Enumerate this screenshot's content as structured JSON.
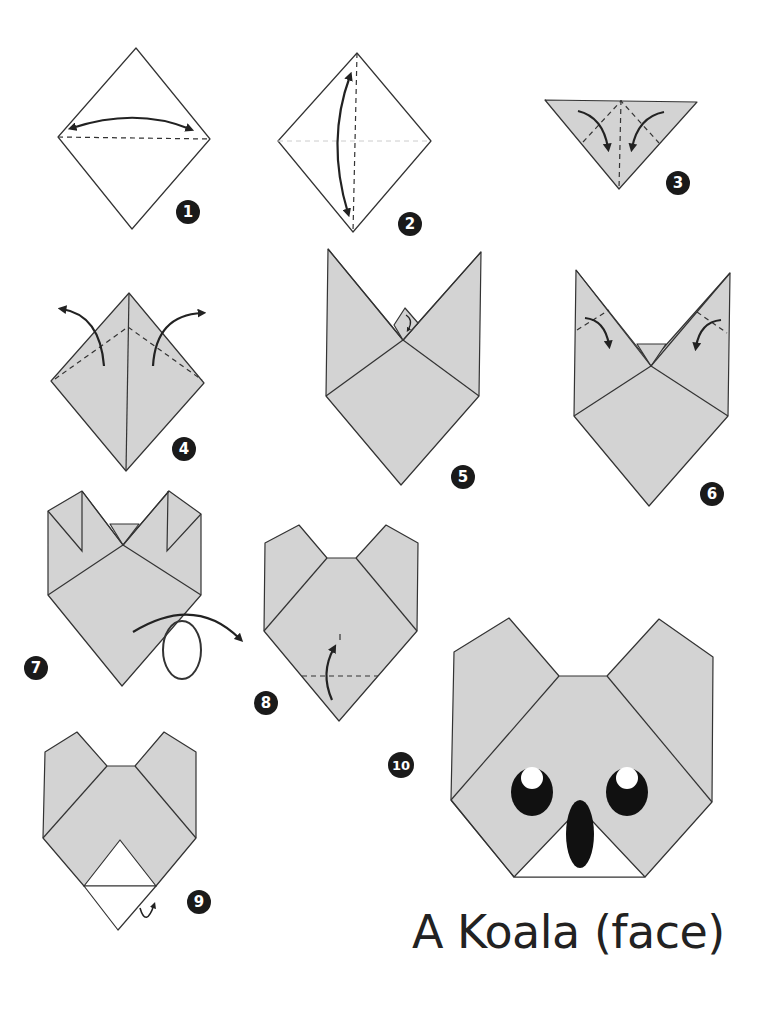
{
  "title": "A Koala (face)",
  "colors": {
    "paper": "#d3d3d3",
    "outline": "#333333",
    "badge": "#1a1a1a",
    "background": "#ffffff"
  },
  "steps": [
    {
      "number": "1",
      "description": "Square diamond, fold top to bottom along horizontal diagonal and unfold"
    },
    {
      "number": "2",
      "description": "Fold left to right along vertical diagonal and unfold"
    },
    {
      "number": "3",
      "description": "Triangle, fold side corners down to center"
    },
    {
      "number": "4",
      "description": "Fold flaps outward"
    },
    {
      "number": "5",
      "description": "Ears formed; fold tip down"
    },
    {
      "number": "6",
      "description": "Fold ear tips inward"
    },
    {
      "number": "7",
      "description": "Turn over"
    },
    {
      "number": "8",
      "description": "Fold bottom corner up"
    },
    {
      "number": "9",
      "description": "Fold tip behind"
    },
    {
      "number": "10",
      "description": "Finished koala face with eyes and nose"
    }
  ]
}
